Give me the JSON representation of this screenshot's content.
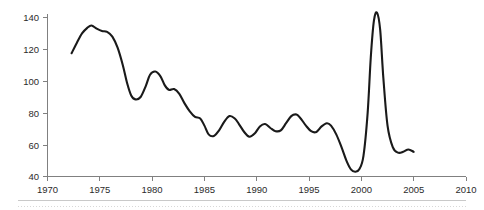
{
  "chart_data": {
    "type": "line",
    "title": "",
    "subtitle": "",
    "xlabel": "",
    "ylabel": "",
    "xlim": [
      1970,
      2010
    ],
    "ylim": [
      40,
      145
    ],
    "grid": false,
    "legend": null,
    "line_color": "#1a1a1a",
    "axis_color": "#808080",
    "xticks": [
      1970,
      1975,
      1980,
      1985,
      1990,
      1995,
      2000,
      2005,
      2010
    ],
    "xtick_labels": [
      "1970",
      "1975",
      "1980",
      "1985",
      "1990",
      "1995",
      "2000",
      "2005",
      "2010"
    ],
    "yticks": [
      40,
      60,
      80,
      100,
      120,
      140
    ],
    "ytick_labels": [
      "40",
      "60",
      "80",
      "100",
      "120",
      "140"
    ],
    "series": [
      {
        "name": "series-1",
        "x": [
          1972.3,
          1972.8,
          1973.3,
          1973.8,
          1974.2,
          1974.7,
          1975.2,
          1975.7,
          1976.2,
          1976.7,
          1977.2,
          1977.6,
          1978.0,
          1978.4,
          1978.9,
          1979.4,
          1979.8,
          1980.3,
          1980.8,
          1981.2,
          1981.6,
          1982.1,
          1982.6,
          1983.1,
          1983.6,
          1984.1,
          1984.6,
          1985.0,
          1985.4,
          1985.9,
          1986.4,
          1986.9,
          1987.4,
          1987.9,
          1988.3,
          1988.8,
          1989.3,
          1989.8,
          1990.3,
          1990.8,
          1991.3,
          1991.8,
          1992.3,
          1992.8,
          1993.3,
          1993.8,
          1994.2,
          1994.7,
          1995.2,
          1995.7,
          1996.2,
          1996.7,
          1997.1,
          1997.6,
          1998.1,
          1998.6,
          1999.0,
          1999.4,
          1999.8,
          2000.2,
          2000.6,
          2000.9,
          2001.2,
          2001.5,
          2001.8,
          2002.1,
          2002.5,
          2003.0,
          2003.5,
          2004.0,
          2004.5,
          2005.0
        ],
        "y": [
          117.5,
          124.0,
          130.0,
          133.5,
          135.0,
          133.0,
          131.5,
          131.0,
          128.0,
          121.0,
          110.0,
          99.0,
          91.0,
          88.5,
          90.0,
          97.0,
          104.0,
          106.0,
          103.0,
          97.5,
          94.5,
          95.0,
          92.0,
          86.0,
          81.0,
          77.5,
          76.5,
          72.0,
          66.5,
          65.5,
          69.0,
          74.5,
          78.0,
          76.5,
          73.0,
          68.0,
          65.0,
          67.0,
          71.5,
          73.0,
          70.5,
          68.5,
          69.0,
          73.5,
          78.0,
          79.0,
          76.5,
          72.0,
          68.5,
          68.0,
          71.5,
          73.5,
          72.0,
          66.5,
          58.5,
          49.5,
          44.5,
          43.0,
          44.5,
          53.0,
          80.0,
          115.0,
          138.0,
          143.0,
          132.0,
          102.0,
          72.0,
          58.5,
          55.0,
          55.5,
          57.0,
          55.5
        ]
      }
    ],
    "annotations": []
  }
}
